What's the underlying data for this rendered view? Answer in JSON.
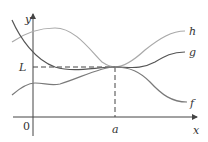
{
  "figure": {
    "axes": {
      "x_label": "x",
      "y_label": "y",
      "origin_label": "0"
    },
    "markers": {
      "limit_label": "L",
      "point_label": "a"
    },
    "curves": [
      {
        "name": "h",
        "label": "h",
        "color": "#a9a9a9",
        "description": "upper bounding function, above g except at a"
      },
      {
        "name": "g",
        "label": "g",
        "color": "#555555",
        "description": "middle function squeezed between f and h"
      },
      {
        "name": "f",
        "label": "f",
        "color": "#7a7a7a",
        "description": "lower bounding function, below g except at a"
      }
    ],
    "colors": {
      "axes": "#444444",
      "dashed_guides": "#444444",
      "background": "#ffffff"
    }
  }
}
